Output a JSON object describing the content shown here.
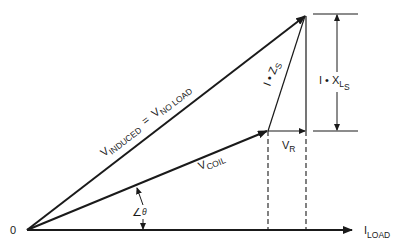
{
  "diagram": {
    "type": "phasor-diagram",
    "colors": {
      "ink": "#1a1a1a",
      "background": "#ffffff"
    },
    "origin_label": "0",
    "axis": {
      "label_main": "I",
      "label_sub": "LOAD"
    },
    "vectors": {
      "induced": {
        "main": "V",
        "sub": "INDUCED",
        "eq": "=",
        "main2": "V",
        "sub2": "NO LOAD"
      },
      "coil": {
        "main": "V",
        "sub": "COIL"
      },
      "resistive": {
        "main": "V",
        "sub": "R"
      },
      "impedance": {
        "main": "I • Z",
        "sub": "S"
      },
      "reactance": {
        "main": "I • X",
        "sub": "L",
        "subsub": "S"
      }
    },
    "angle": {
      "symbol": "∠",
      "greek": "θ"
    }
  }
}
